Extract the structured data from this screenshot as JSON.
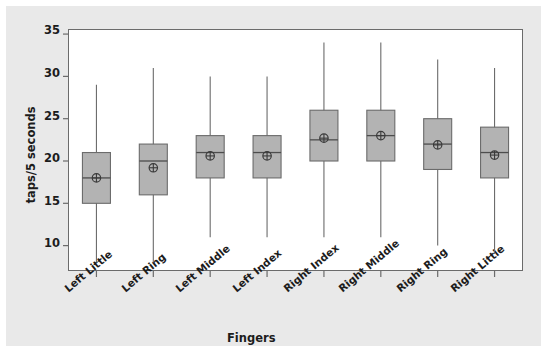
{
  "chart_data": {
    "type": "box",
    "title": "",
    "xlabel": "Fingers",
    "ylabel": "taps/5 seconds",
    "ylim": [
      7,
      35.6
    ],
    "yticks": [
      10,
      15,
      20,
      25,
      30,
      35
    ],
    "ytick_labels": [
      "10",
      "15",
      "20",
      "25",
      "30",
      "35"
    ],
    "grid": false,
    "legend": "none",
    "categories": [
      "Left Little",
      "Left Ring",
      "Left Middle",
      "Left Index",
      "Right Index",
      "Right Middle",
      "Right Ring",
      "Right Little"
    ],
    "boxes": [
      {
        "category": "Left Little",
        "whisker_low": 8.0,
        "q1": 15.0,
        "median": 18.0,
        "q3": 21.0,
        "whisker_high": 29.0,
        "mean": 18.0
      },
      {
        "category": "Left Ring",
        "whisker_low": 8.0,
        "q1": 16.0,
        "median": 20.0,
        "q3": 22.0,
        "whisker_high": 31.0,
        "mean": 19.2
      },
      {
        "category": "Left Middle",
        "whisker_low": 11.0,
        "q1": 18.0,
        "median": 21.0,
        "q3": 23.0,
        "whisker_high": 30.0,
        "mean": 20.6
      },
      {
        "category": "Left Index",
        "whisker_low": 11.0,
        "q1": 18.0,
        "median": 21.0,
        "q3": 23.0,
        "whisker_high": 30.0,
        "mean": 20.6
      },
      {
        "category": "Right Index",
        "whisker_low": 11.0,
        "q1": 20.0,
        "median": 22.5,
        "q3": 26.0,
        "whisker_high": 34.0,
        "mean": 22.7
      },
      {
        "category": "Right Middle",
        "whisker_low": 11.0,
        "q1": 20.0,
        "median": 23.0,
        "q3": 26.0,
        "whisker_high": 34.0,
        "mean": 23.0
      },
      {
        "category": "Right Ring",
        "whisker_low": 10.0,
        "q1": 19.0,
        "median": 22.0,
        "q3": 25.0,
        "whisker_high": 32.0,
        "mean": 21.9
      },
      {
        "category": "Right Little",
        "whisker_low": 9.0,
        "q1": 18.0,
        "median": 21.0,
        "q3": 24.0,
        "whisker_high": 31.0,
        "mean": 20.7
      }
    ],
    "colors": {
      "figure_background": "#e9e9e9",
      "plot_background": "#ffffff",
      "box_fill": "#b3b3b3",
      "box_edge": "#6b6b6b",
      "whisker": "#6b6b6b",
      "median": "#4d4d4d",
      "mean_marker": "#3a3a3a",
      "axis": "#6b6b6b",
      "text": "#1c1c1c"
    }
  }
}
